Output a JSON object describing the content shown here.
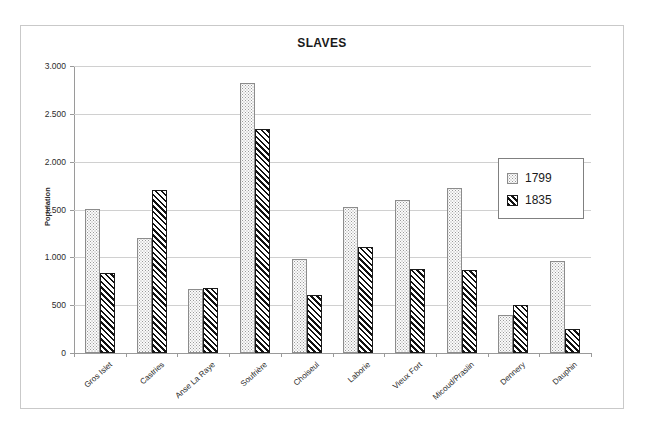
{
  "chart_data": {
    "type": "bar",
    "title": "SLAVES",
    "xlabel": "",
    "ylabel": "Population",
    "ylim": [
      0,
      3000
    ],
    "grid": true,
    "legend_position": "right-inside",
    "ytick_labels": [
      "3.000",
      "2.500",
      "2.000",
      "1.500",
      "1.000",
      "500",
      "0"
    ],
    "ytick_values": [
      3000,
      2500,
      2000,
      1500,
      1000,
      500,
      0
    ],
    "categories": [
      "Gros Islet",
      "Castries",
      "Anse La Raye",
      "Soufrière",
      "Choiseul",
      "Laborie",
      "Vieux Fort",
      "Micoud/Praslin",
      "Dennery",
      "Dauphin"
    ],
    "series": [
      {
        "name": "1799",
        "pattern": "dotted",
        "values": [
          1510,
          1200,
          670,
          2825,
          980,
          1530,
          1600,
          1730,
          395,
          960
        ]
      },
      {
        "name": "1835",
        "pattern": "diagonal-hatch",
        "values": [
          840,
          1700,
          675,
          2340,
          610,
          1110,
          880,
          870,
          505,
          255
        ]
      }
    ]
  },
  "colors": {
    "frame_border": "#c9c9c9",
    "gridline": "#d0d0d0",
    "axis": "#9a9a9a",
    "text": "#1a1a1a",
    "legend_border": "#808080"
  }
}
